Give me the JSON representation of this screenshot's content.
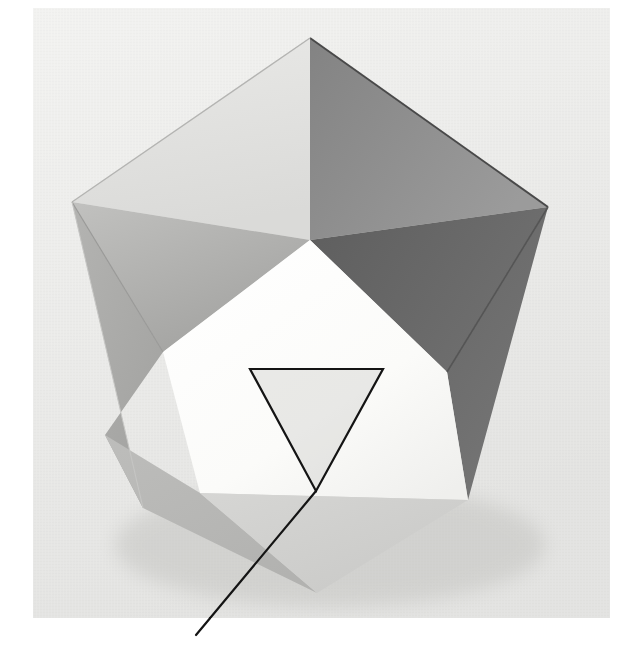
{
  "figure": {
    "kind": "photograph",
    "subject_label": "icosahedron",
    "description": "Photograph of a white/grey polyhedral model (icosahedron) seen nearly face-on, resting on a cloth-textured background, with a thin black inverted triangle drawn over one bright front face and a straight leader line running down-left from the triangle's lower vertex to the bottom edge of the photo.",
    "annotation": {
      "overlay_shape": "inverted-triangle",
      "leader_line": "straight-line",
      "line_color": "#151515",
      "line_width_px": 2
    }
  },
  "canvas": {
    "width": 624,
    "height": 648,
    "page_background": "#ffffff"
  },
  "photo": {
    "left": 33,
    "top": 8,
    "right": 610,
    "bottom": 618,
    "background_top": "#f3f3f1",
    "background_mid": "#e9e9e7",
    "background_bottom": "#dedede",
    "texture": "woven-cloth"
  },
  "solid": {
    "name": "icosahedron",
    "silhouette_vertices": [
      [
        310,
        38
      ],
      [
        548,
        207
      ],
      [
        468,
        500
      ],
      [
        317,
        593
      ],
      [
        143,
        508
      ],
      [
        72,
        202
      ]
    ],
    "interior_vertices": {
      "upper_mid": [
        310,
        240
      ],
      "left_mid": [
        163,
        352
      ],
      "right_mid": [
        447,
        372
      ],
      "lower_left": [
        105,
        435
      ],
      "lower_right": [
        468,
        500
      ]
    }
  },
  "faces": [
    {
      "id": "top-left-face",
      "tone": "#e2e2e0",
      "label": "upper left face (lit)"
    },
    {
      "id": "top-right-face",
      "tone": "#8e8e8e",
      "label": "upper right face (shaded)"
    },
    {
      "id": "right-face",
      "tone": "#686868",
      "label": "right face (darkest)"
    },
    {
      "id": "left-face",
      "tone": "#b6b6b4",
      "label": "left face"
    },
    {
      "id": "left-lower-face",
      "tone": "#ababa9",
      "label": "left lower face"
    },
    {
      "id": "front-face",
      "tone": "#fbfbfa",
      "label": "front face (brightest, annotated)"
    },
    {
      "id": "bottom-left-face",
      "tone": "#b8b8b6",
      "label": "bottom left face"
    },
    {
      "id": "bottom-right-face",
      "tone": "#cfcfcd",
      "label": "bottom right face"
    },
    {
      "id": "bottom-face",
      "tone": "#c4c4c2",
      "label": "bottom face"
    }
  ],
  "overlay": {
    "triangle_vertices": [
      [
        250,
        369
      ],
      [
        383,
        369
      ],
      [
        316,
        491
      ]
    ],
    "triangle_fill": "rgba(190,190,186,0.30)",
    "triangle_stroke": "#141414",
    "leader_from": [
      316,
      491
    ],
    "leader_to": [
      196,
      635
    ]
  },
  "edges": {
    "apex_to_left": [
      [
        310,
        38
      ],
      [
        72,
        202
      ]
    ],
    "apex_to_right": [
      [
        310,
        38
      ],
      [
        548,
        207
      ]
    ],
    "apex_down": [
      [
        310,
        38
      ],
      [
        310,
        240
      ]
    ],
    "right_crease": [
      [
        548,
        207
      ],
      [
        447,
        372
      ]
    ],
    "left_crease": [
      [
        72,
        202
      ],
      [
        163,
        352
      ]
    ]
  }
}
